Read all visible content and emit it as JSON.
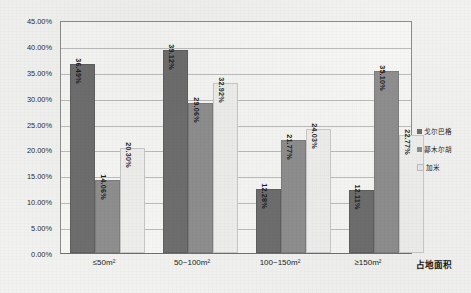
{
  "chart_data": {
    "type": "bar",
    "title": "",
    "subtitle": "",
    "xlabel": "占地面积",
    "ylabel": "",
    "categories": [
      "≤50m²",
      "50~100m²",
      "100~150m²",
      "≥150m²"
    ],
    "series": [
      {
        "name": "戈尔巴格",
        "values": [
          36.49,
          39.12,
          12.28,
          12.11
        ],
        "color": "#6e6e6e"
      },
      {
        "name": "鄯木尔胡",
        "values": [
          14.06,
          29.06,
          21.77,
          35.1
        ],
        "color": "#8f8f8f"
      },
      {
        "name": "加米",
        "values": [
          20.3,
          32.92,
          24.03,
          22.77
        ],
        "color": "#efefed"
      }
    ],
    "labels": [
      [
        "36.49%",
        "14.06%",
        "20.30%"
      ],
      [
        "39.12%",
        "29.06%",
        "32.92%"
      ],
      [
        "12.28%",
        "21.77%",
        "24.03%"
      ],
      [
        "12.11%",
        "35.10%",
        "22.77%"
      ]
    ],
    "ylim": [
      0,
      45
    ],
    "ytick_step": 5,
    "yticks": [
      "0.00%",
      "5.00%",
      "10.00%",
      "15.00%",
      "20.00%",
      "25.00%",
      "30.00%",
      "35.00%",
      "40.00%",
      "45.00%"
    ],
    "ytick_values": [
      0,
      5,
      10,
      15,
      20,
      25,
      30,
      35,
      40,
      45
    ],
    "grid": true,
    "grid_axis": "y",
    "legend_position": "right",
    "value_suffix": "%"
  }
}
